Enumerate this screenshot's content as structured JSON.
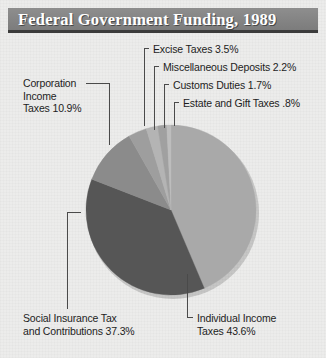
{
  "header": {
    "title": "Federal Government Funding, 1989"
  },
  "colors": {
    "background": "#ececeb",
    "banner": "#848484",
    "banner_underline": "#3b3b3b",
    "title_text": "#ffffff",
    "label_text": "#1d1d1d",
    "leader_line": "#4a4a4a",
    "slice_individual_income": "#a9a9a9",
    "slice_social_insurance": "#565656",
    "slice_corporation_income": "#8b8b8b",
    "slice_excise": "#9e9e9e",
    "slice_miscellaneous": "#b4b4b4",
    "slice_customs": "#a0a0a0",
    "slice_estate_gift": "#bdbdbd"
  },
  "chart_data": {
    "type": "pie",
    "title": "Federal Government Funding, 1989",
    "xlabel": "",
    "ylabel": "",
    "units": "percent",
    "start_angle_deg": 0,
    "direction": "clockwise",
    "legend": "none",
    "grid": false,
    "categories": [
      "Individual Income Taxes",
      "Social Insurance Tax and Contributions",
      "Corporation Income Taxes",
      "Excise Taxes",
      "Miscellaneous Deposits",
      "Customs Duties",
      "Estate and Gift Taxes"
    ],
    "values": [
      43.6,
      37.3,
      10.9,
      3.5,
      2.2,
      1.7,
      0.8
    ],
    "slices": [
      {
        "name": "Individual Income Taxes",
        "value": 43.6,
        "label": "Individual Income\nTaxes 43.6%",
        "color": "#a9a9a9"
      },
      {
        "name": "Social Insurance Tax and Contributions",
        "value": 37.3,
        "label": "Social Insurance Tax\nand Contributions 37.3%",
        "color": "#565656"
      },
      {
        "name": "Corporation Income Taxes",
        "value": 10.9,
        "label": "Corporation\nIncome\nTaxes 10.9%",
        "color": "#8b8b8b"
      },
      {
        "name": "Excise Taxes",
        "value": 3.5,
        "label": "Excise Taxes 3.5%",
        "color": "#9e9e9e"
      },
      {
        "name": "Miscellaneous Deposits",
        "value": 2.2,
        "label": "Miscellaneous Deposits 2.2%",
        "color": "#b4b4b4"
      },
      {
        "name": "Customs Duties",
        "value": 1.7,
        "label": "Customs Duties 1.7%",
        "color": "#a0a0a0"
      },
      {
        "name": "Estate and Gift Taxes",
        "value": 0.8,
        "label": "Estate and Gift Taxes .8%",
        "color": "#bdbdbd"
      }
    ]
  },
  "labels": {
    "excise": "Excise Taxes 3.5%",
    "miscellaneous": "Miscellaneous Deposits 2.2%",
    "customs": "Customs Duties 1.7%",
    "estate": "Estate and Gift Taxes .8%",
    "corporation_line1": "Corporation",
    "corporation_line2": "Income",
    "corporation_line3": "Taxes 10.9%",
    "social_line1": "Social Insurance Tax",
    "social_line2": "and Contributions 37.3%",
    "individual_line1": "Individual Income",
    "individual_line2": "Taxes 43.6%"
  }
}
